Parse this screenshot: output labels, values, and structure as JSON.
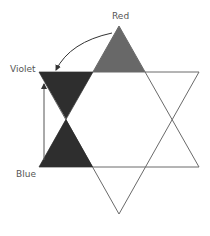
{
  "diagram": {
    "labels": {
      "red": "Red",
      "violet": "Violet",
      "blue": "Blue"
    },
    "colors": {
      "red_fill": "#686868",
      "violet_fill": "#2e2e2e",
      "blue_fill": "#2e2e2e",
      "stroke": "#6a6a6a",
      "arrow": "#333333"
    }
  }
}
